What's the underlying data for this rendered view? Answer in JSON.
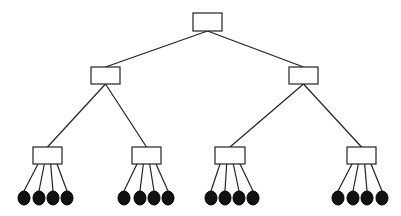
{
  "diagram": {
    "type": "tree",
    "levels": 4,
    "colors": {
      "line": "#222222",
      "box_fill": "#ffffff",
      "leaf_fill": "#111111"
    },
    "root": {
      "x": 193,
      "y": 13,
      "w": 29,
      "h": 18
    },
    "level1": [
      {
        "x": 91,
        "y": 67,
        "w": 29,
        "h": 17
      },
      {
        "x": 289,
        "y": 67,
        "w": 29,
        "h": 17
      }
    ],
    "level2": [
      {
        "x": 33,
        "y": 147,
        "w": 29,
        "h": 17,
        "parent": 0,
        "leaves": [
          24,
          39,
          53,
          67
        ]
      },
      {
        "x": 132,
        "y": 147,
        "w": 29,
        "h": 17,
        "parent": 0,
        "leaves": [
          124,
          140,
          154,
          168
        ]
      },
      {
        "x": 215,
        "y": 147,
        "w": 30,
        "h": 17,
        "parent": 1,
        "leaves": [
          211,
          225,
          239,
          253
        ]
      },
      {
        "x": 347,
        "y": 147,
        "w": 29,
        "h": 17,
        "parent": 1,
        "leaves": [
          338,
          353,
          367,
          382
        ]
      }
    ],
    "leaf_y": 198,
    "leaf_rx": 6,
    "leaf_ry": 7
  }
}
